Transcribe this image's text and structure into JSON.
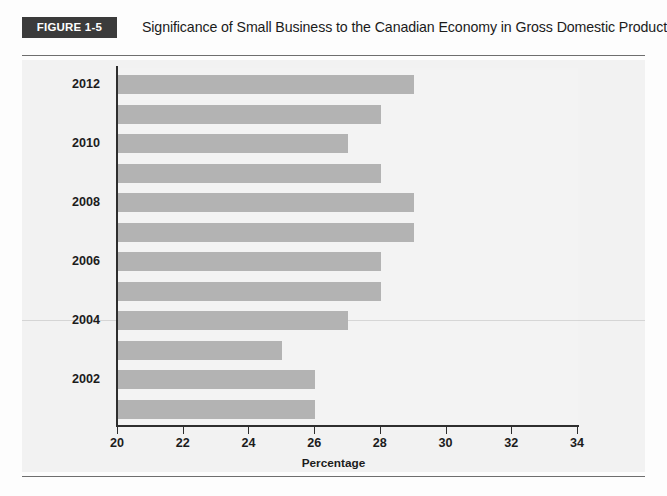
{
  "header": {
    "figure_label": "FIGURE 1-5",
    "title": "Significance of Small Business to the Canadian Economy in Gross Domestic Product",
    "badge_color": "#3b3b3b"
  },
  "chart_data": {
    "type": "bar",
    "orientation": "horizontal",
    "title": "Significance of Small Business to the Canadian Economy in Gross Domestic Product",
    "xlabel": "Percentage",
    "ylabel": "",
    "xlim": [
      20,
      34
    ],
    "xticks": [
      20,
      22,
      24,
      26,
      28,
      30,
      32,
      34
    ],
    "xtick_labels": [
      "20",
      "22",
      "24",
      "26",
      "28",
      "30",
      "32",
      "34"
    ],
    "grid": false,
    "legend": null,
    "bar_color": "#b3b3b3",
    "categories": [
      "2012",
      "2011",
      "2010",
      "2009",
      "2008",
      "2007",
      "2006",
      "2005",
      "2004",
      "2003",
      "2002",
      "2001"
    ],
    "values": [
      29,
      28,
      27,
      28,
      29,
      29,
      28,
      28,
      27,
      25,
      26,
      26
    ],
    "visible_ytick_labels": [
      "2012",
      "2010",
      "2008",
      "2006",
      "2004",
      "2002"
    ]
  }
}
